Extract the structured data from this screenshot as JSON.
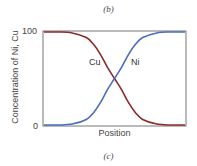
{
  "captions": {
    "top": "(b)",
    "bottom": "(c)"
  },
  "chart_data": {
    "type": "line",
    "title": "",
    "xlabel": "Position",
    "ylabel": "Concentration of Ni, Cu",
    "yticks": [
      "0",
      "100"
    ],
    "ylim": [
      0,
      100
    ],
    "grid": false,
    "legend": "inline labels",
    "x": [
      0,
      0.1,
      0.2,
      0.3,
      0.35,
      0.4,
      0.45,
      0.5,
      0.55,
      0.6,
      0.65,
      0.7,
      0.8,
      0.9,
      1.0
    ],
    "series": [
      {
        "name": "Cu",
        "color": "#8b2a2a",
        "values": [
          100,
          100,
          99,
          94,
          87,
          76,
          62,
          50,
          38,
          24,
          13,
          6,
          1,
          0,
          0
        ]
      },
      {
        "name": "Ni",
        "color": "#4a6cc0",
        "values": [
          0,
          0,
          1,
          6,
          13,
          24,
          38,
          50,
          62,
          76,
          87,
          94,
          99,
          100,
          100
        ]
      }
    ],
    "annotations": [
      "Cu",
      "Ni"
    ]
  },
  "labels": {
    "cu": "Cu",
    "ni": "Ni"
  }
}
